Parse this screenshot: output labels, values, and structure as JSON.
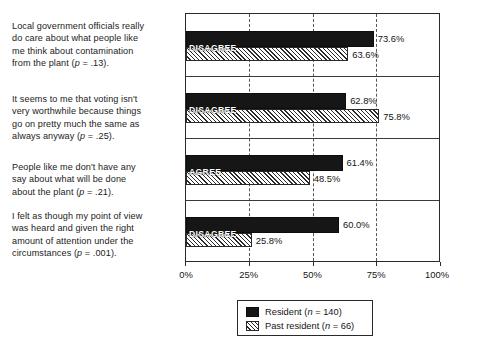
{
  "chart_data": {
    "type": "bar",
    "orientation": "horizontal",
    "title": "",
    "xlabel": "",
    "ylabel": "",
    "xlim": [
      0,
      100
    ],
    "xticks": [
      "0%",
      "25%",
      "50%",
      "75%",
      "100%"
    ],
    "xtick_values": [
      0,
      25,
      50,
      75,
      100
    ],
    "grid": "vertical dashed at 25%, 50%, 75%",
    "legend_position": "bottom-center",
    "categories": [
      "Local government officials really do care about what people like me think about contamination from the plant (p = .13).",
      "It seems to me that voting isn't very worthwhile because things go on pretty much the same as always anyway (p = .25).",
      "People like me don't have any say about what will be done about the plant (p = .21).",
      "I felt as though my point of view was heard and given the right amount of attention under the circumstances (p = .001)."
    ],
    "series": [
      {
        "name": "Resident (n = 140)",
        "values": [
          73.6,
          62.8,
          61.4,
          60.0
        ],
        "labels": [
          "73.6%",
          "62.8%",
          "61.4%",
          "60.0%"
        ],
        "color": "#161616",
        "fill": "solid-black"
      },
      {
        "name": "Past resident (n = 66)",
        "values": [
          63.6,
          75.8,
          48.5,
          25.8
        ],
        "labels": [
          "63.6%",
          "75.8%",
          "48.5%",
          "25.8%"
        ],
        "color": "#ffffff",
        "fill": "diagonal-hatch"
      }
    ],
    "annotations": [
      "DISAGREE",
      "DISAGREE",
      "AGREE",
      "DISAGREE"
    ]
  },
  "statements": [
    {
      "id": "statement-1",
      "line1": "Local government officials really",
      "line2": "do care about what people like",
      "line3": "me think about contamination",
      "line4_pre": "from the plant (",
      "line4_ital": "p",
      "line4_post": " = .13)."
    },
    {
      "id": "statement-2",
      "line1": "It seems to me that voting isn't",
      "line2": "very worthwhile because things",
      "line3": "go on pretty much the same as",
      "line4_pre": "always anyway (",
      "line4_ital": "p",
      "line4_post": " = .25)."
    },
    {
      "id": "statement-3",
      "line1": "People like me don't have any",
      "line2": "say about what will be done",
      "line3": "",
      "line4_pre": "about the plant (",
      "line4_ital": "p",
      "line4_post": " = .21)."
    },
    {
      "id": "statement-4",
      "line1": "I felt as though my point of view",
      "line2": "was heard and given the right",
      "line3": "amount of attention under the",
      "line4_pre": "circumstances (",
      "line4_ital": "p",
      "line4_post": " = .001)."
    }
  ],
  "rows": [
    {
      "overlay": "DISAGREE",
      "resident_value": 73.6,
      "resident_label": "73.6%",
      "past_value": 63.6,
      "past_label": "63.6%"
    },
    {
      "overlay": "DISAGREE",
      "resident_value": 62.8,
      "resident_label": "62.8%",
      "past_value": 75.8,
      "past_label": "75.8%"
    },
    {
      "overlay": "AGREE",
      "resident_value": 61.4,
      "resident_label": "61.4%",
      "past_value": 48.5,
      "past_label": "48.5%"
    },
    {
      "overlay": "DISAGREE",
      "resident_value": 60.0,
      "resident_label": "60.0%",
      "past_value": 25.8,
      "past_label": "25.8%"
    }
  ],
  "axis": {
    "ticks": [
      {
        "label": "0%",
        "value": 0
      },
      {
        "label": "25%",
        "value": 25
      },
      {
        "label": "50%",
        "value": 50
      },
      {
        "label": "75%",
        "value": 75
      },
      {
        "label": "100%",
        "value": 100
      }
    ]
  },
  "legend": {
    "entries": [
      {
        "swatch": "resident",
        "pre": "Resident (",
        "ital": "n",
        "post": " = 140)"
      },
      {
        "swatch": "past",
        "pre": "Past resident (",
        "ital": "n",
        "post": " = 66)"
      }
    ]
  }
}
